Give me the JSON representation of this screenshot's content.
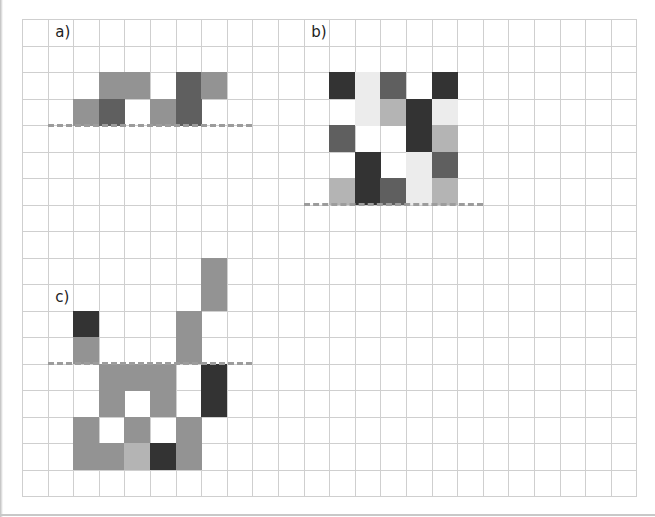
{
  "grid": {
    "origin_x": 22,
    "origin_y": 19,
    "cell_w": 25.6,
    "cell_h": 26.5,
    "cols": 24,
    "rows": 18,
    "line_extent_y": 478,
    "line_color": "#cfcfcf"
  },
  "palette": {
    "black": "#333333",
    "darkgray": "#5f5f5f",
    "midgray": "#939393",
    "lightgray": "#b4b4b4",
    "verylight": "#ececec"
  },
  "figures": [
    {
      "id": "a",
      "label": "a)",
      "label_col": 1.3,
      "label_row": 0.15,
      "dash": {
        "col_start": 1,
        "col_end": 9,
        "row": 4
      },
      "cells": [
        {
          "col": 3,
          "row": 2,
          "shade": "midgray"
        },
        {
          "col": 4,
          "row": 2,
          "shade": "midgray"
        },
        {
          "col": 6,
          "row": 2,
          "shade": "darkgray"
        },
        {
          "col": 7,
          "row": 2,
          "shade": "midgray"
        },
        {
          "col": 2,
          "row": 3,
          "shade": "midgray"
        },
        {
          "col": 3,
          "row": 3,
          "shade": "darkgray"
        },
        {
          "col": 5,
          "row": 3,
          "shade": "midgray"
        },
        {
          "col": 6,
          "row": 3,
          "shade": "darkgray"
        }
      ]
    },
    {
      "id": "b",
      "label": "b)",
      "label_col": 11.3,
      "label_row": 0.15,
      "dash": {
        "col_start": 11,
        "col_end": 18,
        "row": 7
      },
      "cells": [
        {
          "col": 12,
          "row": 2,
          "shade": "black"
        },
        {
          "col": 13,
          "row": 2,
          "shade": "verylight"
        },
        {
          "col": 14,
          "row": 2,
          "shade": "darkgray"
        },
        {
          "col": 16,
          "row": 2,
          "shade": "black"
        },
        {
          "col": 13,
          "row": 3,
          "shade": "verylight"
        },
        {
          "col": 14,
          "row": 3,
          "shade": "lightgray"
        },
        {
          "col": 15,
          "row": 3,
          "shade": "black"
        },
        {
          "col": 16,
          "row": 3,
          "shade": "verylight"
        },
        {
          "col": 12,
          "row": 4,
          "shade": "darkgray"
        },
        {
          "col": 15,
          "row": 4,
          "shade": "black"
        },
        {
          "col": 16,
          "row": 4,
          "shade": "lightgray"
        },
        {
          "col": 13,
          "row": 5,
          "shade": "black"
        },
        {
          "col": 15,
          "row": 5,
          "shade": "verylight"
        },
        {
          "col": 16,
          "row": 5,
          "shade": "darkgray"
        },
        {
          "col": 12,
          "row": 6,
          "shade": "lightgray"
        },
        {
          "col": 13,
          "row": 6,
          "shade": "black"
        },
        {
          "col": 14,
          "row": 6,
          "shade": "darkgray"
        },
        {
          "col": 15,
          "row": 6,
          "shade": "verylight"
        },
        {
          "col": 16,
          "row": 6,
          "shade": "lightgray"
        }
      ]
    },
    {
      "id": "c",
      "label": "c)",
      "label_col": 1.3,
      "label_row": 10.15,
      "dash": {
        "col_start": 1,
        "col_end": 9,
        "row": 13
      },
      "cells": [
        {
          "col": 7,
          "row": 9,
          "shade": "midgray"
        },
        {
          "col": 7,
          "row": 10,
          "shade": "midgray"
        },
        {
          "col": 2,
          "row": 11,
          "shade": "black"
        },
        {
          "col": 6,
          "row": 11,
          "shade": "midgray"
        },
        {
          "col": 2,
          "row": 12,
          "shade": "midgray"
        },
        {
          "col": 6,
          "row": 12,
          "shade": "midgray"
        },
        {
          "col": 3,
          "row": 13,
          "shade": "midgray"
        },
        {
          "col": 4,
          "row": 13,
          "shade": "midgray"
        },
        {
          "col": 5,
          "row": 13,
          "shade": "midgray"
        },
        {
          "col": 7,
          "row": 13,
          "shade": "black"
        },
        {
          "col": 3,
          "row": 14,
          "shade": "midgray"
        },
        {
          "col": 5,
          "row": 14,
          "shade": "midgray"
        },
        {
          "col": 7,
          "row": 14,
          "shade": "black"
        },
        {
          "col": 2,
          "row": 15,
          "shade": "midgray"
        },
        {
          "col": 4,
          "row": 15,
          "shade": "midgray"
        },
        {
          "col": 6,
          "row": 15,
          "shade": "midgray"
        },
        {
          "col": 2,
          "row": 16,
          "shade": "midgray"
        },
        {
          "col": 3,
          "row": 16,
          "shade": "midgray"
        },
        {
          "col": 4,
          "row": 16,
          "shade": "lightgray"
        },
        {
          "col": 5,
          "row": 16,
          "shade": "black"
        },
        {
          "col": 6,
          "row": 16,
          "shade": "midgray"
        }
      ]
    }
  ]
}
